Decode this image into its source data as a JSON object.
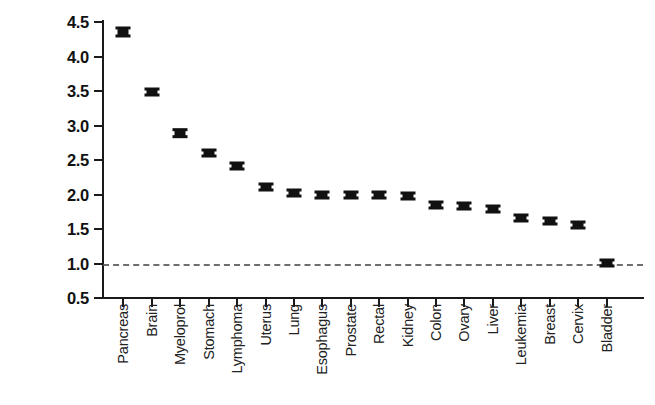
{
  "chart_data": {
    "type": "scatter",
    "title": "",
    "subtitle": "",
    "xlabel": "",
    "ylabel": "Relative Risk of VTE in\nCancer Patients",
    "ylim": [
      0.5,
      4.5
    ],
    "ytick_labels": [
      "0.5",
      "1.0",
      "1.5",
      "2.0",
      "2.5",
      "3.0",
      "3.5",
      "4.0",
      "4.5"
    ],
    "ytick_values": [
      0.5,
      1.0,
      1.5,
      2.0,
      2.5,
      3.0,
      3.5,
      4.0,
      4.5
    ],
    "grid": false,
    "legend": "none",
    "error_bars": true,
    "reference_line": {
      "value": 1.0,
      "style": "dashed",
      "color": "#555555",
      "label": ""
    },
    "marker_color": "#111111",
    "categories": [
      "Pancreas",
      "Brain",
      "Myeloprol",
      "Stomach",
      "Lymphoma",
      "Uterus",
      "Lung",
      "Esophagus",
      "Prostate",
      "Rectal",
      "Kidney",
      "Colon",
      "Ovary",
      "Liver",
      "Leukemia",
      "Breast",
      "Cervix",
      "Bladder"
    ],
    "values": [
      4.35,
      3.49,
      2.89,
      2.6,
      2.41,
      2.11,
      2.02,
      2.0,
      1.99,
      1.99,
      1.98,
      1.85,
      1.83,
      1.79,
      1.66,
      1.62,
      1.56,
      1.01
    ],
    "errors_low": [
      0.08,
      0.05,
      0.07,
      0.05,
      0.04,
      0.04,
      0.03,
      0.05,
      0.04,
      0.04,
      0.04,
      0.04,
      0.04,
      0.04,
      0.04,
      0.03,
      0.04,
      0.03
    ],
    "errors_high": [
      0.08,
      0.05,
      0.07,
      0.05,
      0.04,
      0.04,
      0.03,
      0.05,
      0.04,
      0.04,
      0.04,
      0.04,
      0.04,
      0.04,
      0.04,
      0.03,
      0.04,
      0.03
    ],
    "series": [
      {
        "name": "Relative Risk of VTE",
        "values": [
          4.35,
          3.49,
          2.89,
          2.6,
          2.41,
          2.11,
          2.02,
          2.0,
          1.99,
          1.99,
          1.98,
          1.85,
          1.83,
          1.79,
          1.66,
          1.62,
          1.56,
          1.01
        ]
      }
    ]
  }
}
